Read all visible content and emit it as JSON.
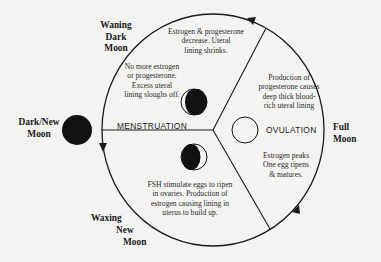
{
  "diagram": {
    "colors": {
      "background": "#f3f3f1",
      "ink": "#1a1a1a"
    },
    "moon_phases": [
      {
        "id": "waning",
        "label": "Waning\nDark\nMoon"
      },
      {
        "id": "dark",
        "label": "Dark/New\nMoon"
      },
      {
        "id": "waxing",
        "label": "Waxing\nNew\nMoon"
      },
      {
        "id": "full",
        "label": "Full\nMoon"
      }
    ],
    "stages": {
      "menstruation": "MENSTRUATION",
      "ovulation": "OVULATION"
    },
    "descriptions": {
      "top": "Estrogen & progesterone\ndecrease. Uteral\nlining shrinks.",
      "menstruation": "No more estrogen\nor progesterone.\nExcess uteral\nlining sloughs off.",
      "luteal": "Production of\nprogesterone causes\ndeep thick blood-\nrich uteral lining",
      "ovulation": "Estrogen peaks\nOne egg ripens\n& matures.",
      "follicular": "FSH stimulate eggs to ripen\nin ovaries. Production of\nestrogen causing lining in\nuterus to build up."
    }
  }
}
